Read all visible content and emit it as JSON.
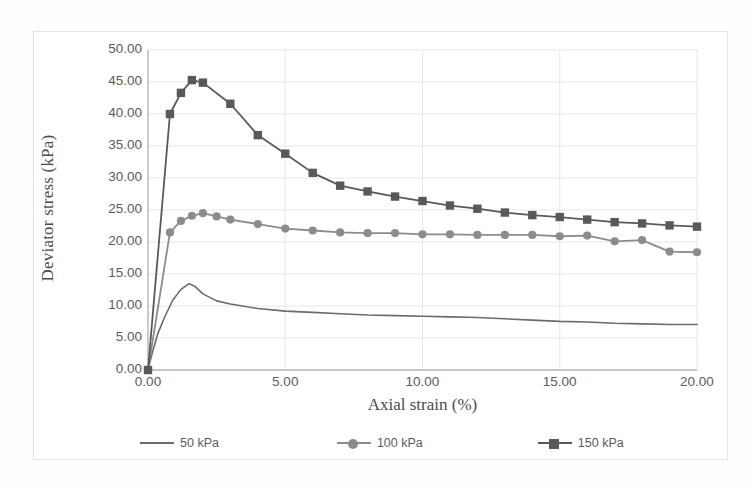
{
  "chart_data": {
    "type": "line",
    "title": "",
    "xlabel": "Axial strain (%)",
    "ylabel": "Deviator stress (kPa)",
    "xlim": [
      0,
      20
    ],
    "ylim": [
      0,
      50
    ],
    "xticks": [
      "0.00",
      "5.00",
      "10.00",
      "15.00",
      "20.00"
    ],
    "yticks": [
      "0.00",
      "5.00",
      "10.00",
      "15.00",
      "20.00",
      "25.00",
      "30.00",
      "35.00",
      "40.00",
      "45.00",
      "50.00"
    ],
    "grid": true,
    "legend_position": "bottom",
    "series": [
      {
        "name": "50 kPa",
        "color": "#6b6b6b",
        "marker": "none",
        "x": [
          0.0,
          0.15,
          0.35,
          0.6,
          0.9,
          1.2,
          1.5,
          1.7,
          2.0,
          2.5,
          3.0,
          4.0,
          5.0,
          6.0,
          7.0,
          8.0,
          9.0,
          10.0,
          11.0,
          12.0,
          13.0,
          14.0,
          15.0,
          16.0,
          17.0,
          18.0,
          19.0,
          20.0
        ],
        "y": [
          0.0,
          2.6,
          5.6,
          8.2,
          10.9,
          12.6,
          13.5,
          13.1,
          11.9,
          10.8,
          10.3,
          9.6,
          9.2,
          9.0,
          8.8,
          8.6,
          8.5,
          8.4,
          8.3,
          8.2,
          8.0,
          7.8,
          7.6,
          7.5,
          7.3,
          7.2,
          7.1,
          7.1
        ]
      },
      {
        "name": "100 kPa",
        "color": "#8c8c8c",
        "marker": "circle",
        "x": [
          0.0,
          0.8,
          1.2,
          1.6,
          2.0,
          2.5,
          3.0,
          4.0,
          5.0,
          6.0,
          7.0,
          8.0,
          9.0,
          10.0,
          11.0,
          12.0,
          13.0,
          14.0,
          15.0,
          16.0,
          17.0,
          18.0,
          19.0,
          20.0
        ],
        "y": [
          0.0,
          21.5,
          23.3,
          24.1,
          24.5,
          24.0,
          23.5,
          22.8,
          22.1,
          21.8,
          21.5,
          21.4,
          21.4,
          21.2,
          21.2,
          21.1,
          21.1,
          21.1,
          20.9,
          21.0,
          20.1,
          20.3,
          18.5,
          18.4
        ]
      },
      {
        "name": "150 kPa",
        "color": "#595959",
        "marker": "square",
        "x": [
          0.0,
          0.8,
          1.2,
          1.6,
          2.0,
          3.0,
          4.0,
          5.0,
          6.0,
          7.0,
          8.0,
          9.0,
          10.0,
          11.0,
          12.0,
          13.0,
          14.0,
          15.0,
          16.0,
          17.0,
          18.0,
          19.0,
          20.0
        ],
        "y": [
          0.0,
          40.0,
          43.3,
          45.3,
          44.9,
          41.6,
          36.7,
          33.8,
          30.8,
          28.8,
          27.9,
          27.1,
          26.4,
          25.7,
          25.2,
          24.6,
          24.2,
          23.9,
          23.5,
          23.1,
          22.9,
          22.6,
          22.4
        ]
      }
    ]
  },
  "legend": {
    "items": [
      {
        "label": "50 kPa"
      },
      {
        "label": "100 kPa"
      },
      {
        "label": "150 kPa"
      }
    ]
  }
}
